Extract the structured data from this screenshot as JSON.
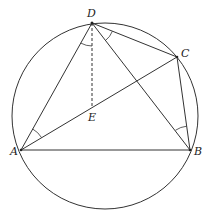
{
  "diagram": {
    "type": "geometry",
    "circle": {
      "cx": 105,
      "cy": 116,
      "r": 93
    },
    "points": {
      "A": {
        "x": 21,
        "y": 150,
        "label": "A",
        "lx": 10,
        "ly": 155
      },
      "B": {
        "x": 190,
        "y": 150,
        "label": "B",
        "lx": 195,
        "ly": 155
      },
      "C": {
        "x": 177,
        "y": 57,
        "label": "C",
        "lx": 182,
        "ly": 57
      },
      "D": {
        "x": 92,
        "y": 23,
        "label": "D",
        "lx": 87,
        "ly": 16
      },
      "E": {
        "x": 92,
        "y": 108,
        "label": "E",
        "lx": 88,
        "ly": 121
      }
    },
    "segments": [
      [
        "A",
        "B"
      ],
      [
        "A",
        "D"
      ],
      [
        "A",
        "C"
      ],
      [
        "D",
        "C"
      ],
      [
        "D",
        "B"
      ],
      [
        "C",
        "B"
      ]
    ],
    "dashed_segments": [
      [
        "D",
        "E"
      ]
    ],
    "angle_marks": [
      "DAC",
      "ADE",
      "BDC",
      "CBD"
    ],
    "colors": {
      "stroke": "#333333",
      "background": "#ffffff"
    }
  }
}
